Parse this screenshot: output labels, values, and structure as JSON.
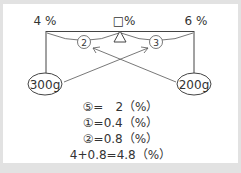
{
  "diagram": {
    "left_percent": "4 %",
    "mid_percent": "□%",
    "right_percent": "6 %",
    "left_ratio": "②",
    "right_ratio": "③",
    "left_weight": "300g",
    "right_weight": "200g"
  },
  "equations": [
    "⑤=　2（%）",
    "①=0.4（%）",
    "②=0.8（%）",
    "4+0.8=4.8（%）"
  ]
}
